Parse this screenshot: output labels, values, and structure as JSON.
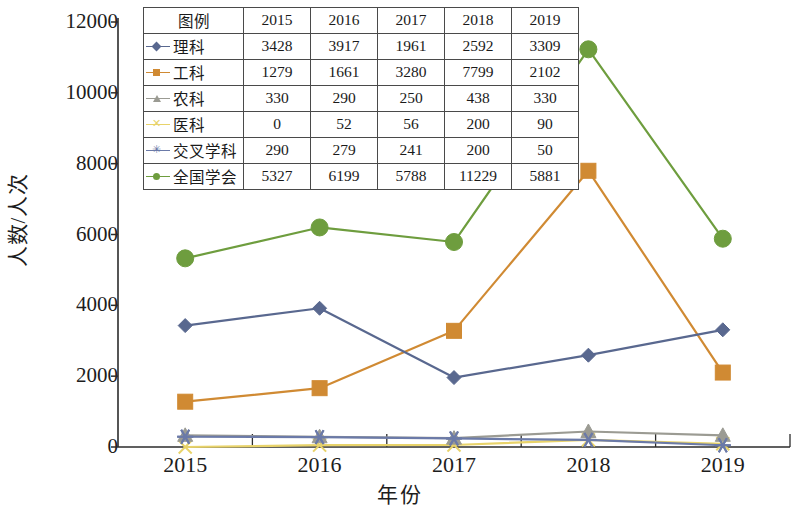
{
  "chart_data": {
    "type": "line",
    "title": "",
    "xlabel": "年份",
    "ylabel": "人数/人次",
    "categories": [
      "2015",
      "2016",
      "2017",
      "2018",
      "2019"
    ],
    "ylim": [
      0,
      12000
    ],
    "y_ticks": [
      "0",
      "2000",
      "4000",
      "6000",
      "8000",
      "10000",
      "12000"
    ],
    "grid": false,
    "legend_position": "top-inside-table",
    "series": [
      {
        "name": "理科",
        "values": [
          3428,
          3917,
          1961,
          2592,
          3309
        ],
        "color": "#59688f",
        "marker": "diamond"
      },
      {
        "name": "工科",
        "values": [
          1279,
          1661,
          3280,
          7799,
          2102
        ],
        "color": "#d08a33",
        "marker": "square"
      },
      {
        "name": "农科",
        "values": [
          330,
          290,
          250,
          438,
          330
        ],
        "color": "#9b9b93",
        "marker": "triangle"
      },
      {
        "name": "医科",
        "values": [
          0,
          52,
          56,
          200,
          90
        ],
        "color": "#e8d36a",
        "marker": "xmark"
      },
      {
        "name": "交叉学科",
        "values": [
          290,
          279,
          241,
          200,
          50
        ],
        "color": "#6b7aa8",
        "marker": "star"
      },
      {
        "name": "全国学会",
        "values": [
          5327,
          6199,
          5788,
          11229,
          5881
        ],
        "color": "#6e9d3e",
        "marker": "circle"
      }
    ]
  },
  "legend_table": {
    "header": [
      "图例",
      "2015",
      "2016",
      "2017",
      "2018",
      "2019"
    ],
    "rows": [
      {
        "label": "理科",
        "values": [
          "3428",
          "3917",
          "1961",
          "2592",
          "3309"
        ]
      },
      {
        "label": "工科",
        "values": [
          "1279",
          "1661",
          "3280",
          "7799",
          "2102"
        ]
      },
      {
        "label": "农科",
        "values": [
          "330",
          "290",
          "250",
          "438",
          "330"
        ]
      },
      {
        "label": "医科",
        "values": [
          "0",
          "52",
          "56",
          "200",
          "90"
        ]
      },
      {
        "label": "交叉学科",
        "values": [
          "290",
          "279",
          "241",
          "200",
          "50"
        ]
      },
      {
        "label": "全国学会",
        "values": [
          "5327",
          "6199",
          "5788",
          "11229",
          "5881"
        ]
      }
    ]
  },
  "axes": {
    "y_title": "人数/人次",
    "x_title": "年份",
    "y_ticks": [
      "12000",
      "10000",
      "8000",
      "6000",
      "4000",
      "2000",
      "0"
    ],
    "x_ticks": [
      "2015",
      "2016",
      "2017",
      "2018",
      "2019"
    ]
  }
}
